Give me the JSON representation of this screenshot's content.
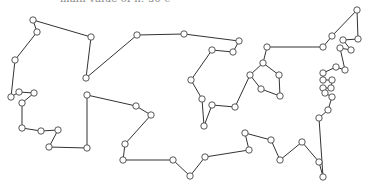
{
  "figure": {
    "caption_clipped": "main value of n: 50 cities",
    "type": "tsp-tour",
    "colors": {
      "edge": "#333333",
      "node_fill": "#ffffff",
      "node_stroke": "#444444"
    },
    "node_radius": 3.2
  },
  "tour": [
    [
      33,
      20
    ],
    [
      91,
      37
    ],
    [
      86,
      78
    ],
    [
      137,
      35
    ],
    [
      184,
      34
    ],
    [
      239,
      41
    ],
    [
      233,
      52
    ],
    [
      212,
      50
    ],
    [
      191,
      80
    ],
    [
      202,
      99
    ],
    [
      204,
      126
    ],
    [
      212,
      105
    ],
    [
      235,
      107
    ],
    [
      250,
      75
    ],
    [
      263,
      63
    ],
    [
      267,
      47
    ],
    [
      323,
      47
    ],
    [
      332,
      36
    ],
    [
      357,
      10
    ],
    [
      358,
      39
    ],
    [
      343,
      40
    ],
    [
      351,
      50
    ],
    [
      340,
      48
    ],
    [
      345,
      70
    ],
    [
      336,
      67
    ],
    [
      323,
      73
    ],
    [
      323,
      80
    ],
    [
      332,
      80
    ],
    [
      331,
      88
    ],
    [
      323,
      88
    ],
    [
      325,
      93
    ],
    [
      332,
      97
    ],
    [
      328,
      110
    ],
    [
      319,
      118
    ],
    [
      323,
      177
    ],
    [
      319,
      162
    ],
    [
      302,
      142
    ],
    [
      280,
      160
    ],
    [
      271,
      140
    ],
    [
      245,
      133
    ],
    [
      249,
      150
    ],
    [
      205,
      157
    ],
    [
      190,
      176
    ],
    [
      173,
      160
    ],
    [
      123,
      160
    ],
    [
      125,
      144
    ],
    [
      151,
      115
    ],
    [
      136,
      106
    ],
    [
      87,
      95
    ],
    [
      87,
      148
    ],
    [
      49,
      147
    ],
    [
      58,
      130
    ],
    [
      41,
      131
    ],
    [
      22,
      128
    ],
    [
      22,
      103
    ],
    [
      34,
      93
    ],
    [
      19,
      92
    ],
    [
      11,
      97
    ],
    [
      15,
      60
    ],
    [
      37,
      32
    ],
    [
      33,
      20
    ]
  ],
  "extra_nodes": [
    [
      261,
      89
    ],
    [
      280,
      96
    ],
    [
      279,
      75
    ]
  ]
}
